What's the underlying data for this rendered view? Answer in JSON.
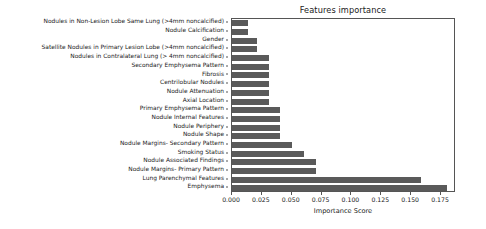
{
  "chart_data": {
    "type": "bar",
    "orientation": "horizontal",
    "title": "Features importance",
    "xlabel": "Importance Score",
    "ylabel": "",
    "xlim": [
      0.0,
      0.1875
    ],
    "grid": false,
    "legend": null,
    "bar_color": "#5a5a5a",
    "xticks": [
      0.0,
      0.025,
      0.05,
      0.075,
      0.1,
      0.125,
      0.15,
      0.175
    ],
    "xtick_labels": [
      "0.000",
      "0.025",
      "0.050",
      "0.075",
      "0.100",
      "0.125",
      "0.150",
      "0.175"
    ],
    "categories": [
      "Nodules in Non-Lesion Lobe Same Lung (>4mm noncalcified)",
      "Nodule Calcification",
      "Gender",
      "Satellite Nodules in Primary Lesion Lobe (>4mm noncalcified)",
      "Nodules in Contralateral Lung (> 4mm noncalcified)",
      "Secondary Emphysema Pattern",
      "Fibrosis",
      "Centrilobular Nodules",
      "Nodule Attenuation",
      "Axial Location",
      "Primary Emphysema Pattern",
      "Nodule Internal Features",
      "Nodule Periphery",
      "Nodule Shape",
      "Nodule Margins- Secondary Pattern",
      "Smoking Status",
      "Nodule Associated Findings",
      "Nodule Margins- Primary Pattern",
      "Lung Parenchymal Features",
      "Emphysema"
    ],
    "values": [
      0.013,
      0.013,
      0.021,
      0.021,
      0.031,
      0.031,
      0.031,
      0.031,
      0.031,
      0.031,
      0.04,
      0.04,
      0.04,
      0.04,
      0.05,
      0.06,
      0.07,
      0.07,
      0.158,
      0.18
    ]
  }
}
